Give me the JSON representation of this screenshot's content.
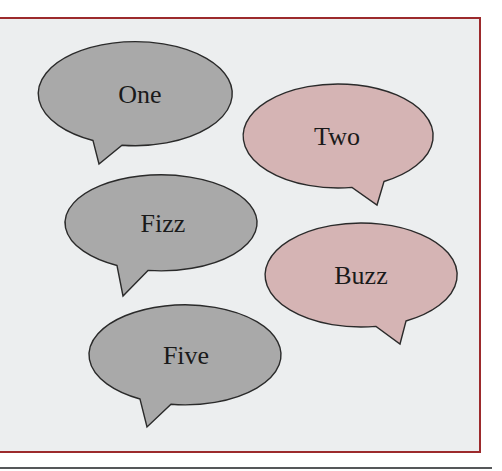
{
  "diagram": {
    "type": "speech-bubbles",
    "colors": {
      "background": "#eceeef",
      "frame_border": "#9c2a2c",
      "gray_bubble": "#a9a9a9",
      "pink_bubble": "#d5b4b4",
      "outline": "#2a2a2a",
      "text": "#1a1a1a",
      "bottom_rule": "#555759"
    },
    "bubbles": [
      {
        "id": "one",
        "label": "One",
        "fill": "gray",
        "cx": 140,
        "cy": 94,
        "rx": 97,
        "ry": 52,
        "tail": [
          [
            93,
            140
          ],
          [
            99,
            164
          ],
          [
            122,
            146
          ]
        ]
      },
      {
        "id": "two",
        "label": "Two",
        "fill": "pink",
        "cx": 337,
        "cy": 136,
        "rx": 95,
        "ry": 52,
        "tail": [
          [
            352,
            187
          ],
          [
            377,
            205
          ],
          [
            384,
            181
          ]
        ]
      },
      {
        "id": "fizz",
        "label": "Fizz",
        "fill": "gray",
        "cx": 163,
        "cy": 223,
        "rx": 96,
        "ry": 48,
        "tail": [
          [
            117,
            270
          ],
          [
            123,
            296
          ],
          [
            148,
            274
          ]
        ]
      },
      {
        "id": "buzz",
        "label": "Buzz",
        "fill": "pink",
        "cx": 361,
        "cy": 275,
        "rx": 96,
        "ry": 52,
        "tail": [
          [
            376,
            326
          ],
          [
            400,
            344
          ],
          [
            406,
            320
          ]
        ]
      },
      {
        "id": "five",
        "label": "Five",
        "fill": "gray",
        "cx": 186,
        "cy": 355,
        "rx": 96,
        "ry": 50,
        "tail": [
          [
            140,
            403
          ],
          [
            147,
            427
          ],
          [
            171,
            410
          ]
        ]
      }
    ]
  }
}
